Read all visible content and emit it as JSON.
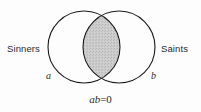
{
  "figure": {
    "type": "venn-diagram",
    "background_color": "#fdfdfd",
    "stroke_color": "#1a1a1a",
    "intersection_fill_color": "#c9c9c9",
    "caption": "ab = 0"
  },
  "sets": {
    "left": {
      "name": "Sinners",
      "variable": "a",
      "center_x": 84,
      "center_y": 47,
      "radius": 36
    },
    "right": {
      "name": "Saints",
      "variable": "b",
      "center_x": 119,
      "center_y": 47,
      "radius": 36
    }
  },
  "equation": {
    "product": "ab",
    "relation": "=",
    "result": "0",
    "full_text": "ab = 0"
  }
}
